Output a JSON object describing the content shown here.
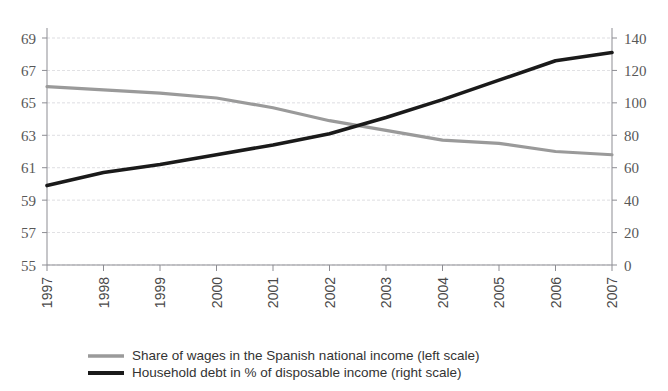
{
  "chart_data": {
    "type": "line",
    "title": "",
    "subtitle": "",
    "xlabel": "",
    "ylabel": "",
    "grid": true,
    "legend_position": "bottom",
    "categories": [
      "1997",
      "1998",
      "1999",
      "2000",
      "2001",
      "2002",
      "2003",
      "2004",
      "2005",
      "2006",
      "2007"
    ],
    "x": [
      1997,
      1998,
      1999,
      2000,
      2001,
      2002,
      2003,
      2004,
      2005,
      2006,
      2007
    ],
    "axes": {
      "left": {
        "label": "",
        "ylim": [
          55,
          69
        ],
        "ticks": [
          55,
          57,
          59,
          61,
          63,
          65,
          67,
          69
        ],
        "tick_labels": [
          "55",
          "57",
          "59",
          "61",
          "63",
          "65",
          "67",
          "69"
        ]
      },
      "right": {
        "label": "",
        "ylim": [
          0,
          140
        ],
        "ticks": [
          0,
          20,
          40,
          60,
          80,
          100,
          120,
          140
        ],
        "tick_labels": [
          "0",
          "20",
          "40",
          "60",
          "80",
          "100",
          "120",
          "140"
        ]
      }
    },
    "series": [
      {
        "name": "Share of wages in the Spanish national income (left scale)",
        "short_name": "share-of-wages",
        "axis": "left",
        "color": "#9a9a9a",
        "values": [
          66.0,
          65.8,
          65.6,
          65.3,
          64.7,
          63.9,
          63.3,
          62.7,
          62.5,
          62.0,
          61.8
        ]
      },
      {
        "name": "Household debt in % of disposable income (right scale)",
        "short_name": "household-debt",
        "axis": "right",
        "color": "#1a1a1a",
        "values": [
          49,
          57,
          62,
          68,
          74,
          81,
          91,
          102,
          114,
          126,
          131
        ]
      }
    ],
    "legend": [
      {
        "label": "Share of wages in the Spanish national income (left scale)",
        "color": "#9a9a9a",
        "marker": "line-gray"
      },
      {
        "label": "Household debt in % of disposable income (right scale)",
        "color": "#1a1a1a",
        "marker": "line-black"
      }
    ]
  }
}
